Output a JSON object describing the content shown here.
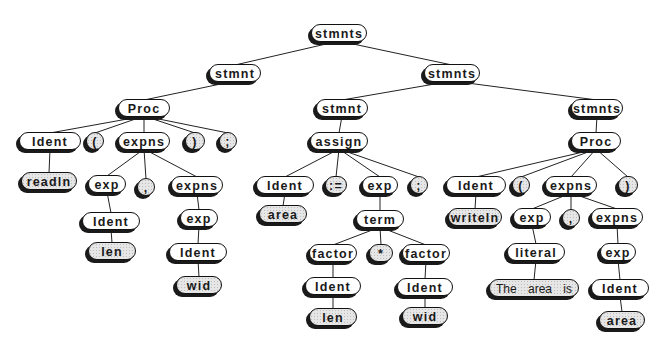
{
  "diagram": {
    "type": "parse-tree",
    "nodes": [
      {
        "id": "n0",
        "label": "stmnts",
        "leaf": false
      },
      {
        "id": "n1",
        "label": "stmnt",
        "leaf": false
      },
      {
        "id": "n2",
        "label": "stmnts",
        "leaf": false
      },
      {
        "id": "n3",
        "label": "Proc",
        "leaf": false
      },
      {
        "id": "n4",
        "label": "Ident",
        "leaf": false
      },
      {
        "id": "n5",
        "label": "(",
        "leaf": true
      },
      {
        "id": "n6",
        "label": "expns",
        "leaf": false
      },
      {
        "id": "n7",
        "label": ")",
        "leaf": true
      },
      {
        "id": "n8",
        "label": ";",
        "leaf": true
      },
      {
        "id": "n9",
        "label": "readln",
        "leaf": true
      },
      {
        "id": "n10",
        "label": "exp",
        "leaf": false
      },
      {
        "id": "n11",
        "label": ",",
        "leaf": true
      },
      {
        "id": "n12",
        "label": "expns",
        "leaf": false
      },
      {
        "id": "n13",
        "label": "Ident",
        "leaf": false
      },
      {
        "id": "n14",
        "label": "len",
        "leaf": true
      },
      {
        "id": "n15",
        "label": "exp",
        "leaf": false
      },
      {
        "id": "n16",
        "label": "Ident",
        "leaf": false
      },
      {
        "id": "n17",
        "label": "wid",
        "leaf": true
      },
      {
        "id": "n18",
        "label": "stmnt",
        "leaf": false
      },
      {
        "id": "n19",
        "label": "stmnts",
        "leaf": false
      },
      {
        "id": "n20",
        "label": "assign",
        "leaf": false
      },
      {
        "id": "n21",
        "label": "Ident",
        "leaf": false
      },
      {
        "id": "n22",
        "label": ":=",
        "leaf": true
      },
      {
        "id": "n23",
        "label": "exp",
        "leaf": false
      },
      {
        "id": "n24",
        "label": ";",
        "leaf": true
      },
      {
        "id": "n25",
        "label": "area",
        "leaf": true
      },
      {
        "id": "n26",
        "label": "term",
        "leaf": false
      },
      {
        "id": "n27",
        "label": "factor",
        "leaf": false
      },
      {
        "id": "n28",
        "label": "*",
        "leaf": true
      },
      {
        "id": "n29",
        "label": "factor",
        "leaf": false
      },
      {
        "id": "n30",
        "label": "Ident",
        "leaf": false
      },
      {
        "id": "n31",
        "label": "len",
        "leaf": true
      },
      {
        "id": "n32",
        "label": "Ident",
        "leaf": false
      },
      {
        "id": "n33",
        "label": "wid",
        "leaf": true
      },
      {
        "id": "n34",
        "label": "Proc",
        "leaf": false
      },
      {
        "id": "n35",
        "label": "Ident",
        "leaf": false
      },
      {
        "id": "n36",
        "label": "(",
        "leaf": true
      },
      {
        "id": "n37",
        "label": "expns",
        "leaf": false
      },
      {
        "id": "n38",
        "label": ")",
        "leaf": true
      },
      {
        "id": "n39",
        "label": "writeln",
        "leaf": true
      },
      {
        "id": "n40",
        "label": "exp",
        "leaf": false
      },
      {
        "id": "n41",
        "label": ",",
        "leaf": true
      },
      {
        "id": "n42",
        "label": "expns",
        "leaf": false
      },
      {
        "id": "n43",
        "label": "literal",
        "leaf": false
      },
      {
        "id": "n44",
        "label": "The area is",
        "leaf": true
      },
      {
        "id": "n45",
        "label": "exp",
        "leaf": false
      },
      {
        "id": "n46",
        "label": "Ident",
        "leaf": false
      },
      {
        "id": "n47",
        "label": "area",
        "leaf": true
      }
    ],
    "edges": [
      [
        "n0",
        "n1"
      ],
      [
        "n0",
        "n2"
      ],
      [
        "n1",
        "n3"
      ],
      [
        "n3",
        "n4"
      ],
      [
        "n3",
        "n5"
      ],
      [
        "n3",
        "n6"
      ],
      [
        "n3",
        "n7"
      ],
      [
        "n3",
        "n8"
      ],
      [
        "n4",
        "n9"
      ],
      [
        "n6",
        "n10"
      ],
      [
        "n6",
        "n11"
      ],
      [
        "n6",
        "n12"
      ],
      [
        "n10",
        "n13"
      ],
      [
        "n13",
        "n14"
      ],
      [
        "n12",
        "n15"
      ],
      [
        "n15",
        "n16"
      ],
      [
        "n16",
        "n17"
      ],
      [
        "n2",
        "n18"
      ],
      [
        "n2",
        "n19"
      ],
      [
        "n18",
        "n20"
      ],
      [
        "n20",
        "n21"
      ],
      [
        "n20",
        "n22"
      ],
      [
        "n20",
        "n23"
      ],
      [
        "n20",
        "n24"
      ],
      [
        "n21",
        "n25"
      ],
      [
        "n23",
        "n26"
      ],
      [
        "n26",
        "n27"
      ],
      [
        "n26",
        "n28"
      ],
      [
        "n26",
        "n29"
      ],
      [
        "n27",
        "n30"
      ],
      [
        "n30",
        "n31"
      ],
      [
        "n29",
        "n32"
      ],
      [
        "n32",
        "n33"
      ],
      [
        "n19",
        "n34"
      ],
      [
        "n34",
        "n35"
      ],
      [
        "n34",
        "n36"
      ],
      [
        "n34",
        "n37"
      ],
      [
        "n34",
        "n38"
      ],
      [
        "n35",
        "n39"
      ],
      [
        "n37",
        "n40"
      ],
      [
        "n37",
        "n41"
      ],
      [
        "n37",
        "n42"
      ],
      [
        "n40",
        "n43"
      ],
      [
        "n43",
        "n44"
      ],
      [
        "n42",
        "n45"
      ],
      [
        "n45",
        "n46"
      ],
      [
        "n46",
        "n47"
      ]
    ]
  }
}
